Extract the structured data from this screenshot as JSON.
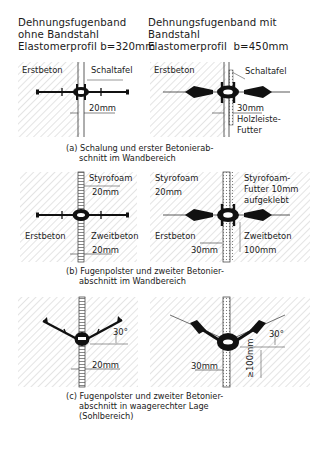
{
  "headers": {
    "left": [
      "Dehnungsfugenband",
      "ohne Bandstahl",
      "Elastomerprofil b=320mm"
    ],
    "right": [
      "Dehnungsfugenband mit",
      "Bandstahl",
      "Elastomerprofil  b=450mm"
    ]
  },
  "panel_a": {
    "left": {
      "erstbeton": "Erstbeton",
      "schaltafel": "Schaltafel",
      "dim": "20mm"
    },
    "right": {
      "erstbeton": "Erstbeton",
      "schaltafel": "Schaltafel",
      "dim": "30mm",
      "holz1": "Holzleiste-",
      "holz2": "Futter"
    },
    "caption": [
      "(a) Schalung und erster Betonierab-",
      "schnitt im Wandbereich"
    ]
  },
  "panel_b": {
    "left": {
      "styrofoam": "Styrofoam",
      "dim_top": "20mm",
      "erstbeton": "Erstbeton",
      "zweitbeton": "Zweitbeton",
      "dim_bottom": "20mm"
    },
    "right": {
      "styrofoam": "Styrofoam",
      "dim_left": "20mm",
      "futter1": "Styrofoam-",
      "futter2": "Futter 10mm",
      "futter3": "aufgeklebt",
      "erstbeton": "Erstbeton",
      "zweitbeton": "Zweitbeton",
      "dim_30": "30mm",
      "dim_100": "100mm"
    },
    "caption": [
      "(b) Fugenpolster und zweiter Betonier-",
      "abschnitt im Wandbereich"
    ]
  },
  "panel_c": {
    "left": {
      "angle": "30°",
      "dim": "20mm"
    },
    "right": {
      "angle": "30°",
      "dim_30": "30mm",
      "dim_100": "≥100mm"
    },
    "caption": [
      "(c) Fugenpolster und zweiter Betonier-",
      "abschnitt in waagerechter Lage",
      "(Sohlbereich)"
    ]
  },
  "colors": {
    "ink": "#1a1a1a",
    "hatch": "#b8b8b8",
    "background": "#ffffff"
  }
}
